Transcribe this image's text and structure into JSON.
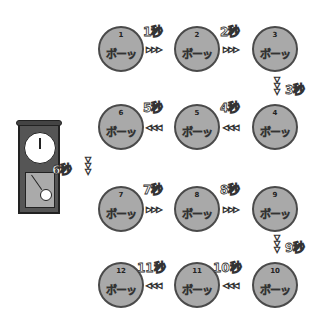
{
  "sound_text": "ボーッ",
  "unit": "秒",
  "nodes": [
    {
      "num": "1",
      "x": 98,
      "y": 26
    },
    {
      "num": "2",
      "x": 174,
      "y": 26
    },
    {
      "num": "3",
      "x": 252,
      "y": 26
    },
    {
      "num": "4",
      "x": 252,
      "y": 104
    },
    {
      "num": "5",
      "x": 174,
      "y": 104
    },
    {
      "num": "6",
      "x": 98,
      "y": 104
    },
    {
      "num": "7",
      "x": 98,
      "y": 186
    },
    {
      "num": "8",
      "x": 174,
      "y": 186
    },
    {
      "num": "9",
      "x": 252,
      "y": 186
    },
    {
      "num": "10",
      "x": 252,
      "y": 262
    },
    {
      "num": "11",
      "x": 174,
      "y": 262
    },
    {
      "num": "12",
      "x": 98,
      "y": 262
    }
  ],
  "labels": [
    {
      "text": "1秒",
      "x": 143,
      "y": 22
    },
    {
      "text": "2秒",
      "x": 220,
      "y": 22
    },
    {
      "text": "3秒",
      "x": 285,
      "y": 80
    },
    {
      "text": "4秒",
      "x": 220,
      "y": 98
    },
    {
      "text": "5秒",
      "x": 143,
      "y": 98
    },
    {
      "text": "6秒",
      "x": 52,
      "y": 160
    },
    {
      "text": "7秒",
      "x": 143,
      "y": 180
    },
    {
      "text": "8秒",
      "x": 220,
      "y": 180
    },
    {
      "text": "9秒",
      "x": 285,
      "y": 238
    },
    {
      "text": "10秒",
      "x": 213,
      "y": 258
    },
    {
      "text": "11秒",
      "x": 137,
      "y": 258
    },
    {
      "text": "12 ",
      "x": 0,
      "y": 0
    }
  ],
  "h_arrows": [
    {
      "dir": "▷▷▷",
      "x": 146,
      "y": 45
    },
    {
      "dir": "▷▷▷",
      "x": 223,
      "y": 45
    },
    {
      "dir": "◁◁◁",
      "x": 223,
      "y": 123
    },
    {
      "dir": "◁◁◁",
      "x": 146,
      "y": 123
    },
    {
      "dir": "▷▷▷",
      "x": 146,
      "y": 205
    },
    {
      "dir": "▷▷▷",
      "x": 223,
      "y": 205
    },
    {
      "dir": "◁◁◁",
      "x": 223,
      "y": 281
    },
    {
      "dir": "◁◁◁",
      "x": 146,
      "y": 281
    }
  ],
  "v_arrows": [
    {
      "x": 272,
      "y": 77
    },
    {
      "x": 83,
      "y": 157
    },
    {
      "x": 272,
      "y": 235
    }
  ]
}
